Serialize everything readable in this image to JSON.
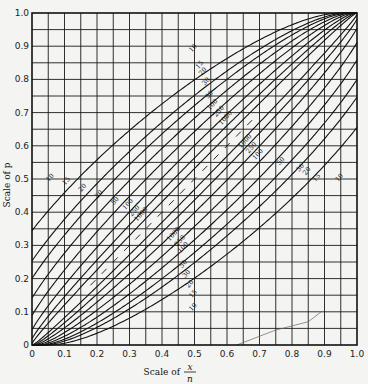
{
  "chart_data": {
    "type": "line",
    "xlabel": "Scale of x/n",
    "xlabel_numerator": "x",
    "xlabel_denominator": "n",
    "xlabel_prefix": "Scale of",
    "ylabel": "Scale of p",
    "xlim": [
      0,
      1
    ],
    "ylim": [
      0,
      1
    ],
    "x_ticks": [
      "0",
      "0.1",
      "0.2",
      "0.3",
      "0.4",
      "0.5",
      "0.6",
      "0.7",
      "0.8",
      "0.9",
      "1.0"
    ],
    "y_ticks": [
      "0",
      "0.1",
      "0.2",
      "0.3",
      "0.4",
      "0.5",
      "0.6",
      "0.7",
      "0.8",
      "0.9",
      "1.0"
    ],
    "grid": true,
    "grid_step": 0.05,
    "confidence_level": 0.95,
    "sample_sizes": [
      10,
      15,
      20,
      30,
      50,
      100,
      250,
      1000
    ],
    "series": [
      {
        "name": "n=10 upper",
        "x": [
          0,
          0.2,
          0.4,
          0.6,
          0.8,
          1.0
        ],
        "values": [
          0.31,
          0.56,
          0.74,
          0.88,
          0.97,
          1.0
        ]
      },
      {
        "name": "n=10 lower",
        "x": [
          0,
          0.2,
          0.4,
          0.6,
          0.8,
          1.0
        ],
        "values": [
          0.0,
          0.03,
          0.12,
          0.26,
          0.44,
          0.69
        ]
      },
      {
        "name": "n=15 upper",
        "x": [
          0,
          0.2,
          0.4,
          0.6,
          0.8,
          1.0
        ],
        "values": [
          0.22,
          0.48,
          0.68,
          0.84,
          0.96,
          1.0
        ]
      },
      {
        "name": "n=15 lower",
        "x": [
          0,
          0.2,
          0.4,
          0.6,
          0.8,
          1.0
        ],
        "values": [
          0.0,
          0.04,
          0.16,
          0.32,
          0.52,
          0.78
        ]
      },
      {
        "name": "n=20 upper",
        "x": [
          0,
          0.2,
          0.4,
          0.6,
          0.8,
          1.0
        ],
        "values": [
          0.17,
          0.44,
          0.64,
          0.81,
          0.94,
          1.0
        ]
      },
      {
        "name": "n=20 lower",
        "x": [
          0,
          0.2,
          0.4,
          0.6,
          0.8,
          1.0
        ],
        "values": [
          0.0,
          0.06,
          0.19,
          0.36,
          0.56,
          0.83
        ]
      },
      {
        "name": "n=30 upper",
        "x": [
          0,
          0.2,
          0.4,
          0.6,
          0.8,
          1.0
        ],
        "values": [
          0.12,
          0.39,
          0.59,
          0.77,
          0.92,
          1.0
        ]
      },
      {
        "name": "n=30 lower",
        "x": [
          0,
          0.2,
          0.4,
          0.6,
          0.8,
          1.0
        ],
        "values": [
          0.0,
          0.08,
          0.23,
          0.41,
          0.61,
          0.88
        ]
      },
      {
        "name": "n=50 upper",
        "x": [
          0,
          0.2,
          0.4,
          0.6,
          0.8,
          1.0
        ],
        "values": [
          0.07,
          0.34,
          0.55,
          0.73,
          0.89,
          1.0
        ]
      },
      {
        "name": "n=50 lower",
        "x": [
          0,
          0.2,
          0.4,
          0.6,
          0.8,
          1.0
        ],
        "values": [
          0.0,
          0.1,
          0.26,
          0.45,
          0.66,
          0.93
        ]
      },
      {
        "name": "n=100 upper",
        "x": [
          0,
          0.2,
          0.4,
          0.6,
          0.8,
          1.0
        ],
        "values": [
          0.04,
          0.29,
          0.5,
          0.69,
          0.87,
          1.0
        ]
      },
      {
        "name": "n=100 lower",
        "x": [
          0,
          0.2,
          0.4,
          0.6,
          0.8,
          1.0
        ],
        "values": [
          0.0,
          0.13,
          0.31,
          0.5,
          0.71,
          0.96
        ]
      },
      {
        "name": "n=250 upper",
        "x": [
          0,
          0.2,
          0.4,
          0.6,
          0.8,
          1.0
        ],
        "values": [
          0.015,
          0.25,
          0.46,
          0.66,
          0.85,
          1.0
        ]
      },
      {
        "name": "n=250 lower",
        "x": [
          0,
          0.2,
          0.4,
          0.6,
          0.8,
          1.0
        ],
        "values": [
          0.0,
          0.15,
          0.34,
          0.54,
          0.75,
          0.985
        ]
      },
      {
        "name": "n=1000 upper",
        "x": [
          0,
          0.2,
          0.4,
          0.6,
          0.8,
          1.0
        ],
        "values": [
          0.004,
          0.23,
          0.43,
          0.63,
          0.83,
          1.0
        ]
      },
      {
        "name": "n=1000 lower",
        "x": [
          0,
          0.2,
          0.4,
          0.6,
          0.8,
          1.0
        ],
        "values": [
          0.0,
          0.17,
          0.37,
          0.57,
          0.77,
          0.996
        ]
      }
    ],
    "upper_labels": [
      {
        "text": "10",
        "x": 0.06,
        "y": 0.5
      },
      {
        "text": "15",
        "x": 0.11,
        "y": 0.49
      },
      {
        "text": "20",
        "x": 0.16,
        "y": 0.47
      },
      {
        "text": "30",
        "x": 0.21,
        "y": 0.45
      },
      {
        "text": "50",
        "x": 0.26,
        "y": 0.43
      },
      {
        "text": "100",
        "x": 0.3,
        "y": 0.42
      },
      {
        "text": "250",
        "x": 0.32,
        "y": 0.4
      },
      {
        "text": "1000",
        "x": 0.34,
        "y": 0.39
      }
    ],
    "lower_labels": [
      {
        "text": "1000",
        "x": 0.44,
        "y": 0.33
      },
      {
        "text": "250",
        "x": 0.46,
        "y": 0.31
      },
      {
        "text": "100",
        "x": 0.47,
        "y": 0.29
      },
      {
        "text": "50",
        "x": 0.47,
        "y": 0.24
      },
      {
        "text": "30",
        "x": 0.48,
        "y": 0.21
      },
      {
        "text": "20",
        "x": 0.49,
        "y": 0.18
      },
      {
        "text": "15",
        "x": 0.5,
        "y": 0.15
      },
      {
        "text": "10",
        "x": 0.5,
        "y": 0.11
      }
    ],
    "upper_right_labels": [
      {
        "text": "10",
        "x": 0.5,
        "y": 0.89
      },
      {
        "text": "15",
        "x": 0.52,
        "y": 0.84
      },
      {
        "text": "20",
        "x": 0.53,
        "y": 0.82
      },
      {
        "text": "30",
        "x": 0.54,
        "y": 0.79
      },
      {
        "text": "50",
        "x": 0.55,
        "y": 0.75
      },
      {
        "text": "100",
        "x": 0.56,
        "y": 0.72
      },
      {
        "text": "250",
        "x": 0.58,
        "y": 0.7
      },
      {
        "text": "1000",
        "x": 0.6,
        "y": 0.68
      }
    ],
    "lower_right_labels": [
      {
        "text": "1000",
        "x": 0.66,
        "y": 0.61
      },
      {
        "text": "250",
        "x": 0.68,
        "y": 0.59
      },
      {
        "text": "100",
        "x": 0.7,
        "y": 0.57
      },
      {
        "text": "50",
        "x": 0.77,
        "y": 0.55
      },
      {
        "text": "30",
        "x": 0.83,
        "y": 0.53
      },
      {
        "text": "20",
        "x": 0.85,
        "y": 0.52
      },
      {
        "text": "15",
        "x": 0.88,
        "y": 0.5
      },
      {
        "text": "10",
        "x": 0.95,
        "y": 0.5
      }
    ]
  },
  "layout": {
    "plot_left": 32,
    "plot_top": 13,
    "plot_right": 357,
    "plot_bottom": 345
  }
}
